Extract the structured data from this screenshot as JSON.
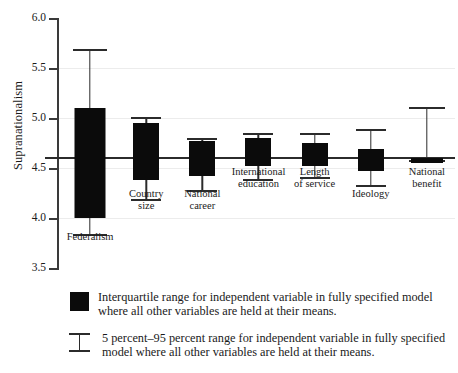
{
  "chart_data": {
    "type": "bar",
    "title": "",
    "subtitle": "",
    "xlabel": "",
    "ylabel": "Supranationalism",
    "ylim": [
      3.5,
      6.0
    ],
    "yticks": [
      "3.5",
      "4.0",
      "4.5",
      "5.0",
      "5.5",
      "6.0"
    ],
    "ytick_values": [
      3.5,
      4.0,
      4.5,
      5.0,
      5.5,
      6.0
    ],
    "grid": true,
    "legend_position": "below-plot",
    "reference_line": {
      "value": 4.6,
      "label": ""
    },
    "categories": [
      "Federalism",
      "Country size",
      "National career",
      "International education",
      "Length of service",
      "Ideology",
      "National benefit"
    ],
    "series": [
      {
        "name": "Interquartile range",
        "q1": [
          4.0,
          4.38,
          4.42,
          4.52,
          4.52,
          4.47,
          4.55
        ],
        "q3": [
          5.1,
          4.95,
          4.77,
          4.8,
          4.75,
          4.69,
          4.6
        ]
      },
      {
        "name": "5 percent-95 percent range",
        "p5": [
          3.83,
          4.18,
          4.27,
          4.38,
          4.4,
          4.32,
          4.57
        ],
        "p95": [
          5.68,
          5.0,
          4.79,
          4.84,
          4.84,
          4.88,
          5.1
        ]
      }
    ]
  },
  "legend": {
    "items": [
      {
        "symbol": "filled-box",
        "text": "Interquartile range for independent variable in fully specified model where all other variables are held at their means."
      },
      {
        "symbol": "i-beam",
        "text": "5 percent–95 percent range for independent variable in fully specified model where all other variables are held at their means."
      }
    ]
  },
  "colors": {
    "box_fill": "#0b0b0b",
    "whisker": "#2b2b2b",
    "axis": "#3a3a3a",
    "grid": "#ececec",
    "reference_line": "#2b2b2b",
    "background": "#ffffff",
    "text": "#1a1a1a"
  }
}
